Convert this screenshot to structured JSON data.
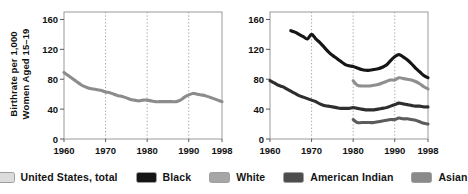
{
  "chart_data": [
    {
      "id": "left",
      "type": "line",
      "title": "",
      "xlabel": "",
      "ylabel": "Birthrate per 1,000 Women Aged 15–19",
      "ylabel_lines": [
        "Birthrate per 1,000",
        "Women Aged 15–19"
      ],
      "xlim": [
        1960,
        1998
      ],
      "ylim": [
        0,
        170
      ],
      "yticks": [
        0,
        40,
        80,
        120,
        160
      ],
      "ytick_labels": [
        "0",
        "40",
        "80",
        "120",
        "160"
      ],
      "xticks": [
        1960,
        1970,
        1980,
        1990,
        1998
      ],
      "xtick_labels": [
        "1960",
        "1970",
        "1980",
        "1990",
        "1998"
      ],
      "grid": "vertical-dotted",
      "gridlines_x": [
        1970,
        1980,
        1990
      ],
      "legend_position": "below-figure",
      "series": [
        {
          "name": "United States, total",
          "color": "#8c8c8c",
          "x": [
            1960,
            1961,
            1962,
            1963,
            1964,
            1965,
            1966,
            1967,
            1968,
            1969,
            1970,
            1971,
            1972,
            1973,
            1974,
            1975,
            1976,
            1977,
            1978,
            1979,
            1980,
            1981,
            1982,
            1983,
            1984,
            1985,
            1986,
            1987,
            1988,
            1989,
            1990,
            1991,
            1992,
            1993,
            1994,
            1995,
            1996,
            1997,
            1998
          ],
          "values": [
            89,
            85,
            81,
            77,
            73,
            70,
            68,
            67,
            66,
            65,
            63,
            62,
            60,
            58,
            57,
            55,
            53,
            52,
            51,
            52,
            52,
            51,
            50,
            50,
            50,
            50,
            50,
            50,
            52,
            56,
            59,
            61,
            60,
            59,
            58,
            56,
            54,
            52,
            50
          ]
        }
      ]
    },
    {
      "id": "right",
      "type": "line",
      "title": "",
      "xlabel": "",
      "ylabel": "",
      "xlim": [
        1960,
        1998
      ],
      "ylim": [
        0,
        170
      ],
      "yticks": [
        0,
        40,
        80,
        120,
        160
      ],
      "ytick_labels": [
        "0",
        "40",
        "80",
        "120",
        "160"
      ],
      "xticks": [
        1960,
        1970,
        1980,
        1990,
        1998
      ],
      "xtick_labels": [
        "1960",
        "1970",
        "1980",
        "1990",
        "1998"
      ],
      "grid": "vertical-dotted",
      "gridlines_x": [
        1970,
        1980,
        1990
      ],
      "legend_position": "below-figure",
      "series": [
        {
          "name": "Black",
          "color": "#121212",
          "x": [
            1965,
            1966,
            1967,
            1968,
            1969,
            1970,
            1971,
            1972,
            1973,
            1974,
            1975,
            1976,
            1977,
            1978,
            1979,
            1980,
            1981,
            1982,
            1983,
            1984,
            1985,
            1986,
            1987,
            1988,
            1989,
            1990,
            1991,
            1992,
            1993,
            1994,
            1995,
            1996,
            1997,
            1998
          ],
          "values": [
            145,
            143,
            140,
            137,
            134,
            140,
            134,
            129,
            123,
            117,
            112,
            108,
            104,
            100,
            98,
            97,
            95,
            93,
            92,
            92,
            93,
            94,
            96,
            99,
            105,
            110,
            113,
            110,
            106,
            101,
            95,
            90,
            85,
            82
          ]
        },
        {
          "name": "White",
          "color": "#8f8f8f",
          "x": [
            1980,
            1981,
            1982,
            1983,
            1984,
            1985,
            1986,
            1987,
            1988,
            1989,
            1990,
            1991,
            1992,
            1993,
            1994,
            1995,
            1996,
            1997,
            1998
          ],
          "values": [
            78,
            72,
            71,
            71,
            71,
            72,
            73,
            75,
            77,
            79,
            79,
            82,
            81,
            80,
            79,
            77,
            74,
            70,
            67
          ]
        },
        {
          "name": "American Indian",
          "color": "#2e2e2e",
          "x": [
            1960,
            1961,
            1962,
            1963,
            1964,
            1965,
            1966,
            1967,
            1968,
            1969,
            1970,
            1971,
            1972,
            1973,
            1974,
            1975,
            1976,
            1977,
            1978,
            1979,
            1980,
            1981,
            1982,
            1983,
            1984,
            1985,
            1986,
            1987,
            1988,
            1989,
            1990,
            1991,
            1992,
            1993,
            1994,
            1995,
            1996,
            1997,
            1998
          ],
          "values": [
            78,
            75,
            72,
            70,
            67,
            64,
            61,
            58,
            56,
            54,
            52,
            50,
            47,
            45,
            44,
            43,
            42,
            41,
            41,
            41,
            42,
            41,
            40,
            39,
            39,
            39,
            40,
            41,
            42,
            44,
            46,
            48,
            47,
            46,
            45,
            44,
            44,
            43,
            43
          ]
        },
        {
          "name": "Asian",
          "color": "#5c5c5c",
          "x": [
            1980,
            1981,
            1982,
            1983,
            1984,
            1985,
            1986,
            1987,
            1988,
            1989,
            1990,
            1991,
            1992,
            1993,
            1994,
            1995,
            1996,
            1997,
            1998
          ],
          "values": [
            26,
            22,
            22,
            22,
            22,
            22,
            23,
            24,
            25,
            26,
            26,
            28,
            27,
            27,
            26,
            25,
            23,
            21,
            20
          ]
        }
      ]
    }
  ],
  "legend": {
    "items": [
      {
        "label": "United States, total",
        "color": "#dcdcdc"
      },
      {
        "label": "Black",
        "color": "#151515"
      },
      {
        "label": "White",
        "color": "#a6a6a6"
      },
      {
        "label": "American Indian",
        "color": "#4d4d4d"
      },
      {
        "label": "Asian",
        "color": "#8a8a8a"
      }
    ]
  }
}
